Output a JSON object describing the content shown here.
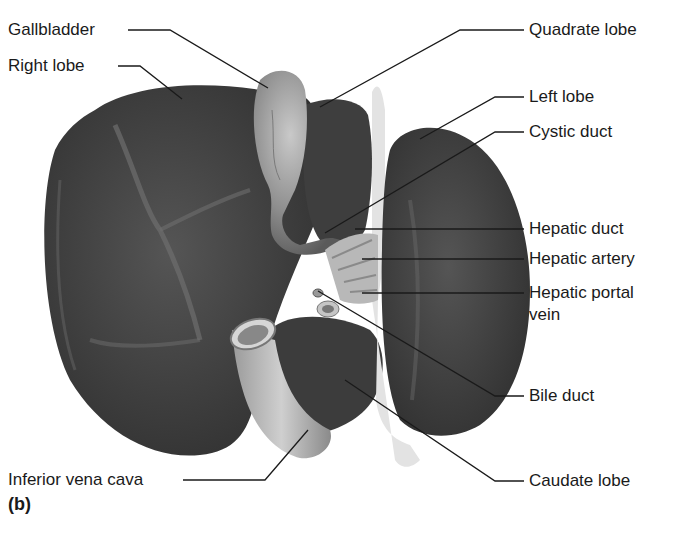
{
  "figure": {
    "panel_letter": "(b)",
    "labels_left": [
      {
        "id": "gallbladder",
        "text": "Gallbladder"
      },
      {
        "id": "right-lobe",
        "text": "Right lobe"
      },
      {
        "id": "inferior-vena-cava",
        "text": "Inferior vena cava"
      }
    ],
    "labels_right": [
      {
        "id": "quadrate-lobe",
        "text": "Quadrate lobe"
      },
      {
        "id": "left-lobe",
        "text": "Left lobe"
      },
      {
        "id": "cystic-duct",
        "text": "Cystic duct"
      },
      {
        "id": "hepatic-duct",
        "text": "Hepatic duct"
      },
      {
        "id": "hepatic-artery",
        "text": "Hepatic artery"
      },
      {
        "id": "hepatic-portal-vein-line1",
        "text": "Hepatic portal"
      },
      {
        "id": "hepatic-portal-vein-line2",
        "text": "vein"
      },
      {
        "id": "bile-duct",
        "text": "Bile duct"
      },
      {
        "id": "caudate-lobe",
        "text": "Caudate lobe"
      }
    ]
  },
  "colors": {
    "background": "#ffffff",
    "lobe_dark": "#3f3f3f",
    "lobe_mid": "#555555",
    "gallbladder": "#8a8a8a",
    "vessel_light": "#bdbdbd",
    "ligament": "#e0e0e0",
    "leader_line": "#1a1a1a",
    "text": "#1a1a1a"
  }
}
